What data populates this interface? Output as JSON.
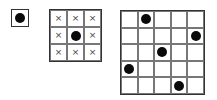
{
  "diagram": {
    "colors": {
      "dot": "#0a0a0a",
      "grid": "#777777",
      "border": "#333333",
      "cross": "#444444"
    },
    "boards": [
      {
        "id": "b1",
        "size": 1,
        "cells": [
          [
            "dot"
          ]
        ]
      },
      {
        "id": "b2",
        "size": 3,
        "cells": [
          [
            "cross",
            "cross",
            "cross"
          ],
          [
            "cross",
            "dot",
            "cross"
          ],
          [
            "cross",
            "cross",
            "cross"
          ]
        ]
      },
      {
        "id": "b3",
        "size": 5,
        "cells": [
          [
            "",
            "dot",
            "",
            "",
            ""
          ],
          [
            "",
            "",
            "",
            "",
            "dot"
          ],
          [
            "",
            "",
            "dot",
            "",
            ""
          ],
          [
            "dot",
            "",
            "",
            "",
            ""
          ],
          [
            "",
            "",
            "",
            "dot",
            ""
          ]
        ]
      }
    ],
    "symbols": {
      "cross": "×",
      "dot": ""
    }
  }
}
